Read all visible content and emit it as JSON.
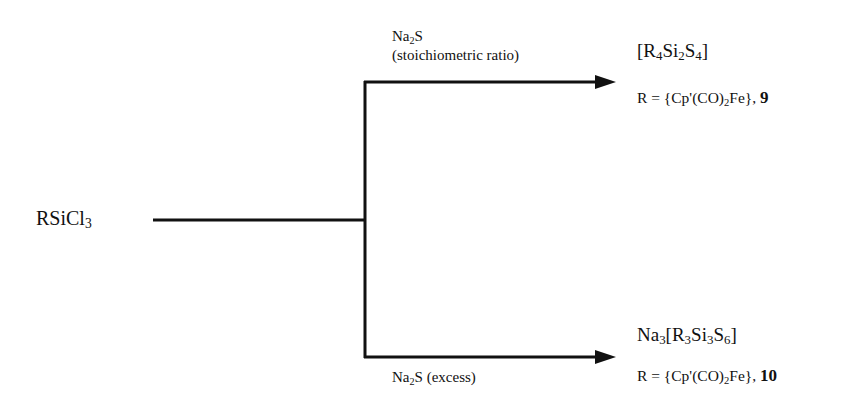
{
  "diagram": {
    "type": "reaction-scheme",
    "starting_material": {
      "label": "RSiCl",
      "sub": "3"
    },
    "branches": [
      {
        "position": "top",
        "reagent": {
          "main": "Na",
          "sub": "2",
          "tail": "S"
        },
        "condition": "(stoichiometric ratio)",
        "product": {
          "parts": [
            {
              "t": "[R"
            },
            {
              "s": "4"
            },
            {
              "t": "Si"
            },
            {
              "s": "2"
            },
            {
              "t": "S"
            },
            {
              "s": "4"
            },
            {
              "t": "]"
            }
          ]
        },
        "r_definition": {
          "prefix": "R = {Cp'(CO)",
          "sub": "2",
          "suffix": "Fe}, ",
          "compound_number": "9"
        }
      },
      {
        "position": "bottom",
        "reagent": {
          "main": "Na",
          "sub": "2",
          "tail": "S (excess)"
        },
        "product": {
          "parts": [
            {
              "t": "Na"
            },
            {
              "s": "3"
            },
            {
              "t": "[R"
            },
            {
              "s": "3"
            },
            {
              "t": "Si"
            },
            {
              "s": "3"
            },
            {
              "t": "S"
            },
            {
              "s": "6"
            },
            {
              "t": "]"
            }
          ]
        },
        "r_definition": {
          "prefix": "R = {Cp'(CO)",
          "sub": "2",
          "suffix": "Fe}, ",
          "compound_number": "10"
        }
      }
    ],
    "line_color": "#111111"
  }
}
